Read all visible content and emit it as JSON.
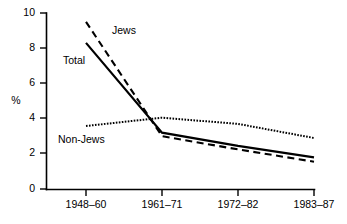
{
  "chart_data": {
    "type": "line",
    "title": "",
    "xlabel": "",
    "ylabel": "%",
    "categories": [
      "1948–60",
      "1961–71",
      "1972–82",
      "1983–87"
    ],
    "ylim": [
      0,
      10
    ],
    "yticks": [
      0,
      2,
      4,
      6,
      8,
      10
    ],
    "ytick_labels": [
      "0",
      "2",
      "4",
      "6",
      "8",
      "10"
    ],
    "grid": false,
    "legend": "inline-labels",
    "series": [
      {
        "name": "Jews",
        "style": "dashed",
        "values": [
          9.5,
          3.0,
          2.25,
          1.55
        ],
        "label_x_category": "1948–60"
      },
      {
        "name": "Total",
        "style": "solid",
        "values": [
          8.3,
          3.2,
          2.45,
          1.8
        ],
        "label_x_category": "1948–60"
      },
      {
        "name": "Non-Jews",
        "style": "dotted",
        "values": [
          3.58,
          4.05,
          3.7,
          2.9
        ],
        "label_x_category": "1948–60"
      }
    ],
    "annotations": [
      {
        "text": "Jews",
        "x": 112,
        "y": 31
      },
      {
        "text": "Total",
        "x": 63,
        "y": 61
      },
      {
        "text": "Non-Jews",
        "x": 58,
        "y": 140
      }
    ],
    "colors": {
      "axis": "#000000",
      "series_total": "#000000",
      "series_jews": "#000000",
      "series_nonjews": "#000000",
      "background": "#ffffff"
    }
  },
  "axis": {
    "y_label": "%",
    "y_tick_0": "0",
    "y_tick_2": "2",
    "y_tick_4": "4",
    "y_tick_6": "6",
    "y_tick_8": "8",
    "y_tick_10": "10",
    "x_tick_1": "1948–60",
    "x_tick_2": "1961–71",
    "x_tick_3": "1972–82",
    "x_tick_4": "1983–87"
  },
  "labels": {
    "jews": "Jews",
    "total": "Total",
    "nonjews": "Non-Jews"
  }
}
